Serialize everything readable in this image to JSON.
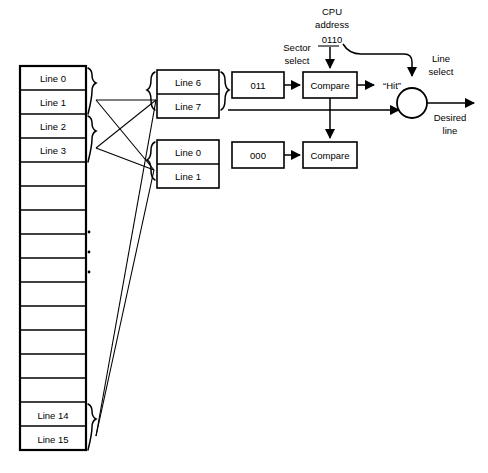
{
  "diagram": {
    "type": "block-diagram"
  },
  "main_memory": {
    "name": "main-memory-column",
    "total_cells": 16,
    "cells": [
      {
        "index": 0,
        "label": "Line  0"
      },
      {
        "index": 1,
        "label": "Line  1"
      },
      {
        "index": 2,
        "label": "Line  2"
      },
      {
        "index": 3,
        "label": "Line  3"
      },
      {
        "index": 4,
        "label": ""
      },
      {
        "index": 5,
        "label": ""
      },
      {
        "index": 6,
        "label": ""
      },
      {
        "index": 7,
        "label": ""
      },
      {
        "index": 8,
        "label": ""
      },
      {
        "index": 9,
        "label": ""
      },
      {
        "index": 10,
        "label": ""
      },
      {
        "index": 11,
        "label": ""
      },
      {
        "index": 12,
        "label": ""
      },
      {
        "index": 13,
        "label": ""
      },
      {
        "index": 14,
        "label": "Line 14"
      },
      {
        "index": 15,
        "label": "Line 15"
      }
    ],
    "ellipsis": "⋮"
  },
  "cache_sectors": [
    {
      "name": "sector-upper",
      "lines": [
        {
          "label": "Line 6"
        },
        {
          "label": "Line 7"
        }
      ],
      "tag": "011"
    },
    {
      "name": "sector-lower",
      "lines": [
        {
          "label": "Line 0"
        },
        {
          "label": "Line 1"
        }
      ],
      "tag": "000"
    }
  ],
  "comparators": [
    {
      "name": "compare-upper",
      "label": "Compare"
    },
    {
      "name": "compare-lower",
      "label": "Compare"
    }
  ],
  "cpu": {
    "title_line1": "CPU",
    "title_line2": "address",
    "address": "0110",
    "sector_select_line1": "Sector",
    "sector_select_line2": "select",
    "line_select_line1": "Line",
    "line_select_line2": "select"
  },
  "outputs": {
    "hit": "“Hit”",
    "desired_line1": "Desired",
    "desired_line2": "line"
  },
  "colors": {
    "stroke": "#000000",
    "fill": "#ffffff"
  }
}
